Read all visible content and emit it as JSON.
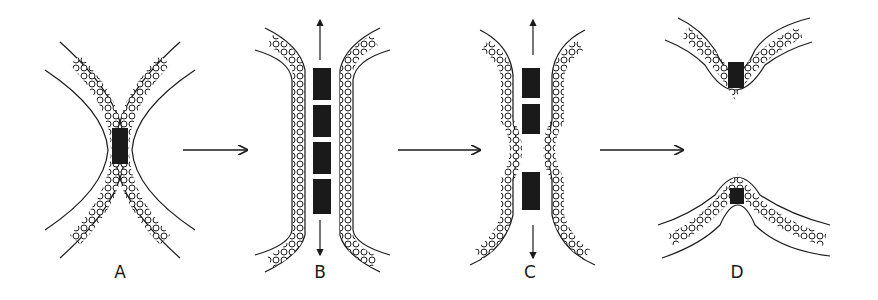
{
  "figure": {
    "panels": [
      {
        "id": "A",
        "label": "A",
        "x": 120,
        "description": "Two curved lipid bilayers in contact forming an X shape with a small dark contact zone at center"
      },
      {
        "id": "B",
        "label": "B",
        "x": 320,
        "description": "Elongated fused region with stacked dark zones and vertical stretching arrows"
      },
      {
        "id": "C",
        "label": "C",
        "x": 530,
        "description": "Constriction forming in the middle; two dark zones separated by a pinched X region"
      },
      {
        "id": "D",
        "label": "D",
        "x": 737,
        "description": "Separated V-shaped (top) and inverted-V (bottom) bilayers with dark residual zones"
      }
    ],
    "arrows": [
      {
        "from": "A",
        "to": "B",
        "x1": 183,
        "x2": 247,
        "y": 150
      },
      {
        "from": "B",
        "to": "C",
        "x1": 398,
        "x2": 480,
        "y": 150
      },
      {
        "from": "C",
        "to": "D",
        "x1": 600,
        "x2": 683,
        "y": 150
      }
    ],
    "colors": {
      "ink": "#1a1a1a",
      "background": "#ffffff"
    }
  }
}
